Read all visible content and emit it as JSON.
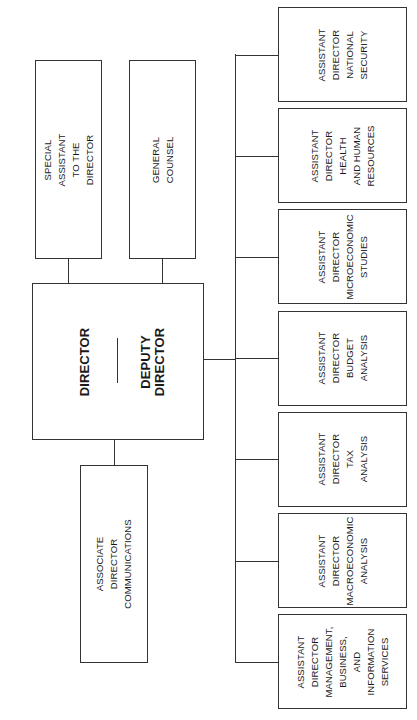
{
  "staff": {
    "special_assistant": "SPECIAL ASSISTANT\nTO THE DIRECTOR",
    "general_counsel": "GENERAL COUNSEL"
  },
  "director": {
    "director": "DIRECTOR",
    "deputy": "DEPUTY DIRECTOR"
  },
  "associate": {
    "communications": "ASSOCIATE DIRECTOR\nCOMMUNICATIONS"
  },
  "assistant_directors": [
    {
      "label": "ASSISTANT\nDIRECTOR\nNATIONAL\nSECURITY"
    },
    {
      "label": "ASSISTANT\nDIRECTOR\nHEALTH\nAND HUMAN\nRESOURCES"
    },
    {
      "label": "ASSISTANT\nDIRECTOR\nMICROECONOMIC\nSTUDIES"
    },
    {
      "label": "ASSISTANT\nDIRECTOR\nBUDGET\nANALYSIS"
    },
    {
      "label": "ASSISTANT\nDIRECTOR\nTAX\nANALYSIS"
    },
    {
      "label": "ASSISTANT\nDIRECTOR\nMACROECONOMIC\nANALYSIS"
    },
    {
      "label": "ASSISTANT\nDIRECTOR\nMANAGEMENT,\nBUSINESS, AND\nINFORMATION\nSERVICES"
    }
  ]
}
